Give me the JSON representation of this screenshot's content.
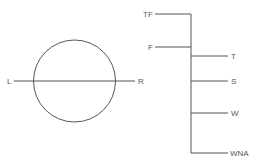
{
  "diagram": {
    "stroke_color": "#555555",
    "left_figure": {
      "shape": "circle-with-horizontal-axis",
      "labels": {
        "left": "L",
        "right": "R"
      }
    },
    "right_figure": {
      "shape": "vertical-tree",
      "left_branches": [
        {
          "label": "TF"
        },
        {
          "label": "F"
        }
      ],
      "right_branches": [
        {
          "label": "T"
        },
        {
          "label": "S"
        },
        {
          "label": "W"
        },
        {
          "label": "WNA"
        }
      ]
    }
  }
}
